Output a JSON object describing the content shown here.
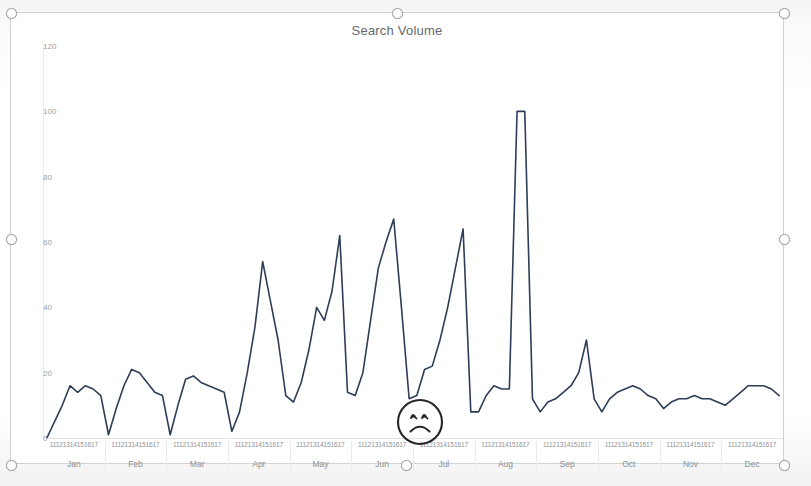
{
  "visual": {
    "title": "Search Volume",
    "line_color": "#2d3d57",
    "frame_border_color": "#d2d2d2",
    "axis_label_color": "#8d9195"
  },
  "selection": {
    "handle_name": "resize-handle",
    "handles": [
      {
        "name": "resize-handle-top-left",
        "x": 6,
        "y": 8
      },
      {
        "name": "resize-handle-top-center",
        "x": 392,
        "y": 8
      },
      {
        "name": "resize-handle-top-right",
        "x": 779,
        "y": 8
      },
      {
        "name": "resize-handle-middle-left",
        "x": 6,
        "y": 234
      },
      {
        "name": "resize-handle-middle-right",
        "x": 779,
        "y": 234
      },
      {
        "name": "resize-handle-bottom-left",
        "x": 6,
        "y": 460
      },
      {
        "name": "resize-handle-bottom-center",
        "x": 401,
        "y": 460
      },
      {
        "name": "resize-handle-bottom-right",
        "x": 779,
        "y": 460
      }
    ]
  },
  "annotation": {
    "type": "sad-face",
    "label": "sad-face-annotation",
    "color": "#26262b"
  },
  "chart_data": {
    "type": "line",
    "title": "Search Volume",
    "xlabel": "",
    "ylabel": "",
    "ylim": [
      0,
      120
    ],
    "yticks": [
      0,
      20,
      40,
      60,
      80,
      100,
      120
    ],
    "grid": false,
    "legend": "none",
    "month_labels": [
      "Jan",
      "Feb",
      "Mar",
      "Apr",
      "May",
      "Jun",
      "Jul",
      "Aug",
      "Sep",
      "Oct",
      "Nov",
      "Dec"
    ],
    "tick_labels_per_month": [
      "1",
      "11",
      "21",
      "31",
      "41",
      "51",
      "61",
      "7"
    ],
    "series": [
      {
        "name": "Search Volume",
        "color": "#2d3d57",
        "segments": [
          {
            "month": "Jan",
            "values": [
              0,
              5,
              10,
              16,
              14,
              16,
              15,
              13
            ]
          },
          {
            "month": "Feb",
            "values": [
              1,
              9,
              16,
              21,
              20,
              17,
              14,
              13
            ]
          },
          {
            "month": "Mar",
            "values": [
              1,
              10,
              18,
              19,
              17,
              16,
              15,
              14
            ]
          },
          {
            "month": "Apr",
            "values": [
              2,
              8,
              20,
              34,
              54,
              42,
              30,
              13
            ]
          },
          {
            "month": "May",
            "values": [
              11,
              17,
              27,
              40,
              36,
              45,
              62,
              14
            ]
          },
          {
            "month": "Jun",
            "values": [
              13,
              20,
              36,
              52,
              60,
              67,
              40,
              12
            ]
          },
          {
            "month": "Jul",
            "values": [
              13,
              21,
              22,
              30,
              40,
              52,
              64,
              8
            ]
          },
          {
            "month": "Aug",
            "values": [
              8,
              13,
              16,
              15,
              15,
              100,
              100,
              12
            ]
          },
          {
            "month": "Sep",
            "values": [
              8,
              11,
              12,
              14,
              16,
              20,
              30,
              12
            ]
          },
          {
            "month": "Oct",
            "values": [
              8,
              12,
              14,
              15,
              16,
              15,
              13,
              12
            ]
          },
          {
            "month": "Nov",
            "values": [
              9,
              11,
              12,
              12,
              13,
              12,
              12,
              11
            ]
          },
          {
            "month": "Dec",
            "values": [
              10,
              12,
              14,
              16,
              16,
              16,
              15,
              13
            ]
          }
        ]
      }
    ]
  }
}
